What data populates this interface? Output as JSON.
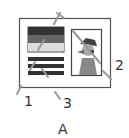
{
  "diagram": {
    "caption": "A",
    "labels": [
      {
        "id": "1",
        "text": "1"
      },
      {
        "id": "2",
        "text": "2"
      },
      {
        "id": "3",
        "text": "3"
      }
    ],
    "colors": {
      "frame": "#555555",
      "text_dark": "#333333",
      "text_mid": "#777777",
      "text_light": "#dddddd",
      "pointer": "#999999"
    }
  }
}
